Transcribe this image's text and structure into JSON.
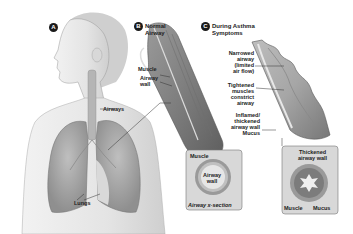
{
  "diagram": {
    "panels": [
      {
        "id": "A",
        "badge": "A",
        "title": "",
        "labels": {
          "airways": "Airways",
          "lungs": "Lungs"
        }
      },
      {
        "id": "B",
        "badge": "B",
        "title_line1": "Normal",
        "title_line2": "Airway",
        "labels": {
          "muscle": "Muscle",
          "airway_wall_1": "Airway",
          "airway_wall_2": "wall"
        },
        "inset": {
          "muscle": "Muscle",
          "airway_wall_1": "Airway",
          "airway_wall_2": "wall",
          "caption": "Airway x-section"
        }
      },
      {
        "id": "C",
        "badge": "C",
        "title_line1": "During Asthma",
        "title_line2": "Symptoms",
        "labels": {
          "narrowed_1": "Narrowed",
          "narrowed_2": "airway",
          "narrowed_3": "(limited",
          "narrowed_4": "air flow)",
          "tightened_1": "Tightened",
          "tightened_2": "muscles",
          "tightened_3": "constrict",
          "tightened_4": "airway",
          "inflamed_1": "Inflamed/",
          "inflamed_2": "thickened",
          "inflamed_3": "airway wall",
          "mucus": "Mucus"
        },
        "inset": {
          "thickened_1": "Thickened",
          "thickened_2": "airway wall",
          "muscle": "Muscle",
          "mucus": "Mucus"
        }
      }
    ],
    "colors": {
      "skin": "#e6e6e6",
      "lung": "#a9a9a9",
      "airway_tissue": "#8c8c8c",
      "inset_bg": "#d8d8d8",
      "text": "#222222"
    }
  }
}
